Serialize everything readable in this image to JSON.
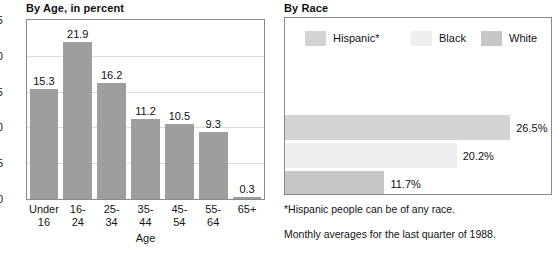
{
  "age_panel": {
    "title": "By Age, in percent",
    "axis_label": "Age"
  },
  "race_panel": {
    "title": "By Race",
    "footnote_1": "*Hispanic people can be of any race.",
    "footnote_2": "Monthly averages for the last quarter of 1988."
  },
  "colors": {
    "age_bar": "#9e9e9e",
    "hispanic": "#d3d3d3",
    "black": "#efefef",
    "white": "#c6c6c6",
    "frame": "#8a8a8a",
    "gridline": "#dcdcdc"
  },
  "chart_data": [
    {
      "type": "bar",
      "title": "By Age, in percent",
      "xlabel": "Age",
      "ylabel": "",
      "ylim": [
        0,
        25
      ],
      "yticks": [
        0,
        5,
        10,
        15,
        20,
        25
      ],
      "grid": true,
      "legend": "none",
      "orientation": "vertical",
      "categories": [
        "Under 16",
        "16-24",
        "25-34",
        "35-44",
        "45-54",
        "55-64",
        "65+"
      ],
      "tick_labels": [
        "Under\n16",
        "16-\n24",
        "25-\n34",
        "35-\n44",
        "45-\n54",
        "55-\n64",
        "65+"
      ],
      "values": [
        15.3,
        21.9,
        16.2,
        11.2,
        10.5,
        9.3,
        0.3
      ],
      "data_labels": [
        "15.3",
        "21.9",
        "16.2",
        "11.2",
        "10.5",
        "9.3",
        "0.3"
      ]
    },
    {
      "type": "bar",
      "title": "By Race",
      "orientation": "horizontal",
      "xlabel": "",
      "ylabel": "",
      "xlim": [
        0,
        30
      ],
      "grid": false,
      "legend": "top",
      "categories": [
        "Hispanic*",
        "Black",
        "White"
      ],
      "values": [
        26.5,
        20.2,
        11.7
      ],
      "data_labels": [
        "26.5%",
        "20.2%",
        "11.7%"
      ],
      "annotations": [
        "*Hispanic people can be of any race.",
        "Monthly averages for the last quarter of 1988."
      ]
    }
  ]
}
